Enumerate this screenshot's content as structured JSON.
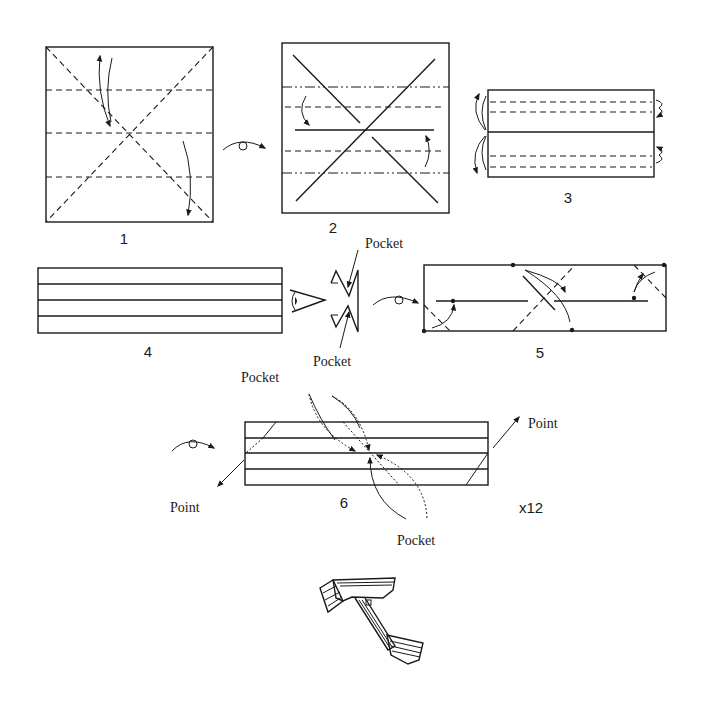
{
  "diagram": {
    "title": "",
    "colors": {
      "ink": "#1a1a1a",
      "paper": "#ffffff"
    },
    "steps": [
      {
        "id": 1,
        "label": "1",
        "description": "Square with diagonal and horizontal valley-fold creases; fold and unfold"
      },
      {
        "id": 2,
        "label": "2",
        "description": "Turn over; mountain and valley folds, fold edges to center"
      },
      {
        "id": 3,
        "label": "3",
        "description": "Rectangle with valley folds; fold outer layers behind"
      },
      {
        "id": 4,
        "label": "4",
        "description": "Long strip with four layers; side view showing pockets"
      },
      {
        "id": 5,
        "label": "5",
        "description": "Turn over; fold corners and crease diagonally"
      },
      {
        "id": 6,
        "label": "6",
        "description": "Unit showing points and pockets"
      }
    ],
    "labels": {
      "pocket_top": "Pocket",
      "pocket_bottom": "Pocket",
      "pocket_step6_top": "Pocket",
      "pocket_step6_bottom": "Pocket",
      "point_left": "Point",
      "point_right": "Point",
      "multiplier": "x12"
    },
    "symbols": [
      "turn-over-icon",
      "turn-over-icon",
      "turn-over-icon",
      "eye-view-icon"
    ]
  }
}
